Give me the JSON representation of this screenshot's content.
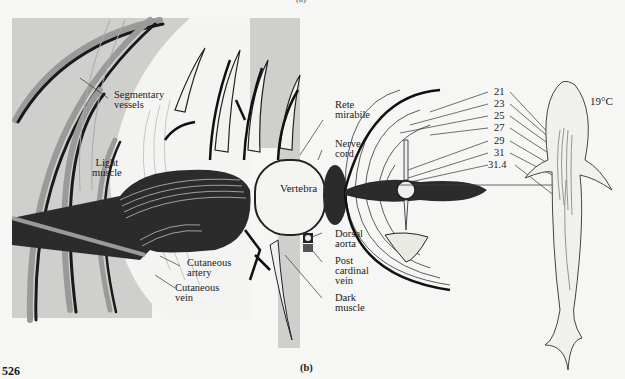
{
  "figure": {
    "page_number": "526",
    "panel_label_top": "(a)",
    "panel_label": "(b)"
  },
  "left_diagram": {
    "labels": {
      "segmentary_vessels": [
        "Segmentary",
        "vessels"
      ],
      "light_muscle": [
        "Light",
        "muscle"
      ],
      "rete_mirabile": [
        "Rete",
        "mirabile"
      ],
      "nerve_cord": [
        "Nerve",
        "cord"
      ],
      "vertebra": "Vertebra",
      "dorsal_aorta": [
        "Dorsal",
        "aorta"
      ],
      "post_cardinal_vein": [
        "Post",
        "cardinal",
        "vein"
      ],
      "dark_muscle": [
        "Dark",
        "muscle"
      ],
      "cutaneous_artery": [
        "Cutaneous",
        "artery"
      ],
      "cutaneous_vein": [
        "Cutaneous",
        "vein"
      ]
    }
  },
  "right_diagram": {
    "ambient_temperature": "19°C",
    "isotherms": [
      "21",
      "23",
      "25",
      "27",
      "29",
      "31",
      "31.4"
    ]
  },
  "colors": {
    "background": "#f6f6f4",
    "gray_panel": "#c9c9c7",
    "dark_muscle": "#2b2b2b",
    "line": "#1a1a1a"
  }
}
